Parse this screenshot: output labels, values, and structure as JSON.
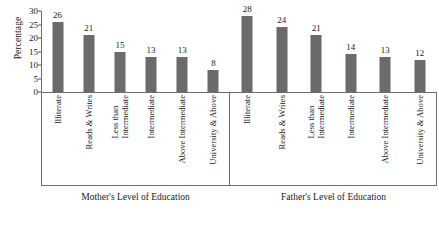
{
  "chart_data": {
    "type": "bar",
    "title": "",
    "xlabel": "",
    "ylabel": "Percentage",
    "ylim": [
      0,
      30
    ],
    "yticks": [
      0,
      5,
      10,
      15,
      20,
      25,
      30
    ],
    "grid": false,
    "legend": "none",
    "categories": [
      "Illiterate",
      "Less than Intermediate",
      "Reads & Writes",
      "Intermediate",
      "Above Intermediate",
      "University & Above"
    ],
    "groups": [
      {
        "caption": "Mother's Level of Education",
        "categories": [
          "Illiterate",
          "Reads & Writes",
          "Less than Intermediate",
          "Intermediate",
          "Above Intermediate",
          "University & Above"
        ],
        "values": [
          26,
          21,
          15,
          13,
          13,
          8
        ]
      },
      {
        "caption": "Father's Level of Education",
        "categories": [
          "Illiterate",
          "Reads & Writes",
          "Less than Intermediate",
          "Intermediate",
          "Above Intermediate",
          "University & Above"
        ],
        "values": [
          28,
          24,
          21,
          14,
          13,
          12
        ]
      }
    ],
    "bar_color": "#6b6b6b",
    "axis_color": "#6d6d6d",
    "background": "#ffffff"
  },
  "axis": {
    "y_label": "Percentage",
    "tick_labels": [
      "30",
      "25",
      "20",
      "15",
      "10",
      "5",
      "0"
    ]
  }
}
